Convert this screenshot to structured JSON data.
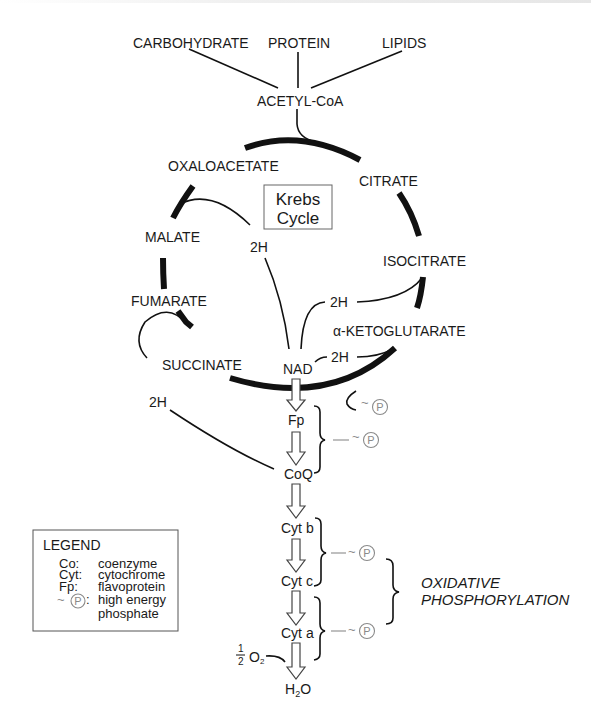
{
  "sources": {
    "carbohydrate": "CARBOHYDRATE",
    "protein": "PROTEIN",
    "lipids": "LIPIDS",
    "acetyl_coa": "ACETYL-CoA"
  },
  "krebs_cycle": {
    "title_line1": "Krebs",
    "title_line2": "Cycle",
    "intermediates": {
      "oxaloacetate": "OXALOACETATE",
      "citrate": "CITRATE",
      "isocitrate": "ISOCITRATE",
      "alpha_ketoglutarate": "α-KETOGLUTARATE",
      "succinate": "SUCCINATE",
      "fumarate": "FUMARATE",
      "malate": "MALATE"
    },
    "hydrogen_labels": {
      "malate_2h": "2H",
      "isocitrate_2h": "2H",
      "ketoglutarate_2h": "2H",
      "succinate_2h": "2H"
    }
  },
  "electron_transport": {
    "nad": "NAD",
    "fp": "Fp",
    "coq": "CoQ",
    "cyt_b": "Cyt b",
    "cyt_c": "Cyt c",
    "cyt_a": "Cyt a",
    "water_h": "H",
    "water_sub": "2",
    "water_o": "O",
    "oxygen_num": "1",
    "oxygen_den": "2",
    "oxygen_o": "O",
    "oxygen_sub": "2"
  },
  "phosphate": {
    "tilde": "~",
    "symbol": "P"
  },
  "oxidative_phosphorylation": {
    "line1": "OXIDATIVE",
    "line2": "PHOSPHORYLATION"
  },
  "legend": {
    "title": "LEGEND",
    "items": [
      {
        "abbr": "Co:",
        "meaning": "coenzyme"
      },
      {
        "abbr": "Cyt:",
        "meaning": "cytochrome"
      },
      {
        "abbr": "Fp:",
        "meaning": "flavoprotein"
      },
      {
        "abbr": ":",
        "meaning": "high energy"
      },
      {
        "abbr": "",
        "meaning": "phosphate"
      }
    ]
  },
  "colors": {
    "ink": "#1a1a1a",
    "phosphate_gray": "#8a8a8a",
    "background": "#ffffff"
  }
}
